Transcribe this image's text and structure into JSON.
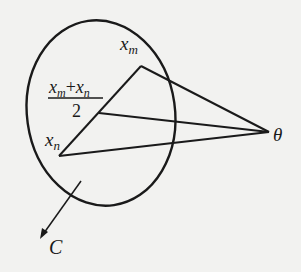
{
  "diagram": {
    "type": "geometric-figure",
    "colors": {
      "ink": "#1a1a1a",
      "paper": "#f2f2f0"
    },
    "labels": {
      "xm": {
        "base": "x",
        "sub": "m"
      },
      "xn": {
        "base": "x",
        "sub": "n"
      },
      "midpoint": {
        "num_a": "x",
        "sub_a": "m",
        "plus": "+",
        "num_b": "x",
        "sub_b": "n",
        "den": "2"
      },
      "theta": "θ",
      "set": "C"
    },
    "points": {
      "xm": [
        141,
        66
      ],
      "mid": [
        99,
        113
      ],
      "xn": [
        59,
        156
      ],
      "theta": [
        269,
        132
      ]
    }
  }
}
